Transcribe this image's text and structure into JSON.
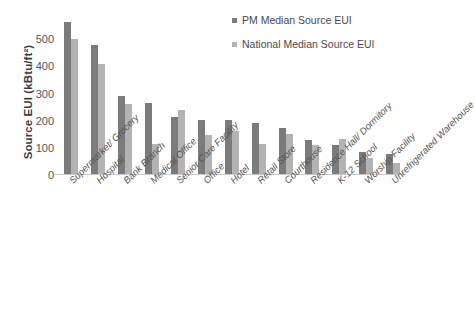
{
  "chart_data": {
    "type": "bar",
    "title": "",
    "xlabel": "",
    "ylabel": "Source EUI (kBtu/ft²)",
    "ylim": [
      0,
      600
    ],
    "yticks": [
      0,
      100,
      200,
      300,
      400,
      500
    ],
    "grid": false,
    "legend_position": "top-right",
    "categories": [
      "Supermarket/ Grocery",
      "Hospital",
      "Bank Branch",
      "Medical Office",
      "Senior Care Facility",
      "Office",
      "Hotel",
      "Retail Store",
      "Courthouse",
      "Residence Hall/ Dormitory",
      "K-12 School",
      "Worship Facility",
      "Unrefrigerated Warehouse"
    ],
    "series": [
      {
        "name": "PM Median Source EUI",
        "color": "#7b7b7b",
        "values": [
          565,
          480,
          290,
          265,
          215,
          202,
          201,
          192,
          174,
          129,
          110,
          86,
          78
        ]
      },
      {
        "name": "National Median Source EUI",
        "color": "#b3b3b3",
        "values": [
          501,
          410,
          262,
          115,
          240,
          148,
          162,
          113,
          152,
          109,
          133,
          62,
          45
        ]
      }
    ]
  },
  "legend": {
    "items": [
      {
        "label": "PM Median Source EUI",
        "swatch": "pm"
      },
      {
        "label": "National Median Source EUI",
        "swatch": "nat"
      }
    ]
  }
}
